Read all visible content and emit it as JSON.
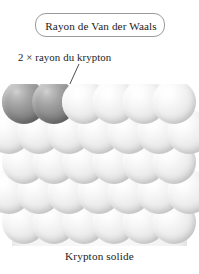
{
  "figure": {
    "width": 199,
    "height": 274,
    "background_color": "#ffffff",
    "caption": "Krypton solide"
  },
  "callout_box": {
    "label": "Rayon de Van der Waals",
    "border_color": "#9a9a9a",
    "text_color": "#1c1c1c"
  },
  "annotation": {
    "label": "2 × rayon du krypton",
    "text_color": "#1c1c1c",
    "leader_line_color": "#3a3a3a"
  },
  "measurement": {
    "line_color": "#101010",
    "dot_color": "#000000",
    "from": {
      "x": 42,
      "y": 102
    },
    "to": {
      "x": 72,
      "y": 125
    },
    "meaning": "centre-to-centre distance between two adjacent krypton atoms"
  },
  "colors": {
    "pale_sphere": "#ededed",
    "dark_sphere": "#8e8e8e",
    "lattice_background": "#f6f6f6"
  },
  "lattice": {
    "type": "close-packed-spheres",
    "sphere_diameter": 44,
    "row_spacing": 30,
    "rows": [
      {
        "y": 18,
        "spheres": [
          {
            "x": 24,
            "shade": "dark"
          },
          {
            "x": 54,
            "shade": "dark"
          },
          {
            "x": 84,
            "shade": "pale"
          },
          {
            "x": 114,
            "shade": "pale"
          },
          {
            "x": 144,
            "shade": "pale"
          },
          {
            "x": 174,
            "shade": "pale"
          }
        ]
      },
      {
        "y": 48,
        "spheres": [
          {
            "x": 9,
            "shade": "pale"
          },
          {
            "x": 39,
            "shade": "pale"
          },
          {
            "x": 69,
            "shade": "pale"
          },
          {
            "x": 99,
            "shade": "pale"
          },
          {
            "x": 129,
            "shade": "pale"
          },
          {
            "x": 159,
            "shade": "pale"
          },
          {
            "x": 189,
            "shade": "pale"
          }
        ]
      },
      {
        "y": 78,
        "spheres": [
          {
            "x": 24,
            "shade": "pale"
          },
          {
            "x": 54,
            "shade": "pale"
          },
          {
            "x": 84,
            "shade": "pale"
          },
          {
            "x": 114,
            "shade": "pale"
          },
          {
            "x": 144,
            "shade": "pale"
          },
          {
            "x": 174,
            "shade": "pale"
          }
        ]
      },
      {
        "y": 108,
        "spheres": [
          {
            "x": 9,
            "shade": "pale"
          },
          {
            "x": 39,
            "shade": "pale"
          },
          {
            "x": 69,
            "shade": "pale"
          },
          {
            "x": 99,
            "shade": "pale"
          },
          {
            "x": 129,
            "shade": "pale"
          },
          {
            "x": 159,
            "shade": "pale"
          },
          {
            "x": 189,
            "shade": "pale"
          }
        ]
      },
      {
        "y": 138,
        "spheres": [
          {
            "x": 24,
            "shade": "pale"
          },
          {
            "x": 54,
            "shade": "pale"
          },
          {
            "x": 84,
            "shade": "pale"
          },
          {
            "x": 114,
            "shade": "pale"
          },
          {
            "x": 144,
            "shade": "pale"
          },
          {
            "x": 174,
            "shade": "pale"
          }
        ]
      }
    ]
  }
}
